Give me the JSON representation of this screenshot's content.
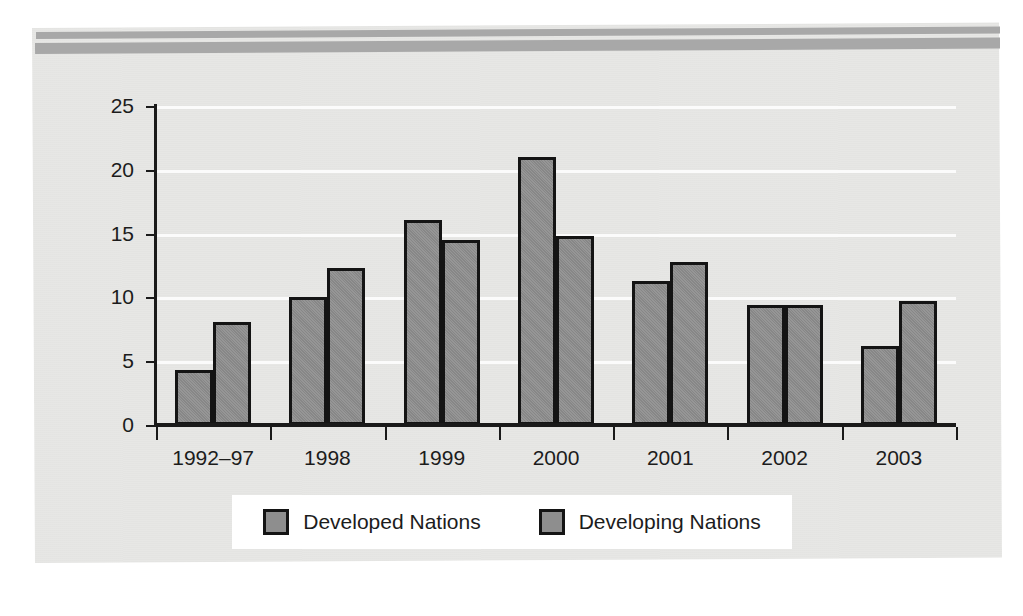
{
  "chart_data": {
    "type": "bar",
    "title": "",
    "subtitle": "",
    "xlabel": "",
    "ylabel": "",
    "ylim": [
      0,
      25
    ],
    "yticks": [
      0,
      5,
      10,
      15,
      20,
      25
    ],
    "ytick_labels": [
      "0",
      "5",
      "10",
      "15",
      "20",
      "25"
    ],
    "grid": true,
    "grid_axis": "y",
    "legend_position": "bottom-center",
    "categories": [
      "1992–97",
      "1998",
      "1999",
      "2000",
      "2001",
      "2002",
      "2003"
    ],
    "series": [
      {
        "name": "Developed Nations",
        "color": "#8e8e8e",
        "values": [
          4.3,
          10.0,
          16.1,
          21.0,
          11.3,
          9.4,
          6.2
        ]
      },
      {
        "name": "Developing Nations",
        "color": "#8e8e8e",
        "values": [
          8.1,
          12.3,
          14.5,
          14.8,
          12.8,
          9.4,
          9.7
        ]
      }
    ]
  },
  "legend": {
    "items": [
      {
        "label": "Developed Nations",
        "swatch_color": "#8e8e8e"
      },
      {
        "label": "Developing Nations",
        "swatch_color": "#8e8e8e"
      }
    ]
  },
  "figure": {
    "page_background": "#ffffff",
    "panel_background": "#e7e7e5",
    "rule_color": "#a8a8a8",
    "axis_color": "#1a1a1a",
    "gridline_color": "#fbfbfb",
    "bar_fill": "#8e8e8e",
    "bar_outline": "#141414",
    "text_color": "#1c1c1c"
  }
}
